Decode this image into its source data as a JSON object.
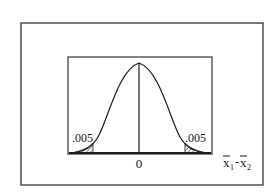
{
  "diagram": {
    "type": "normal-distribution",
    "left_tail_label": ".005",
    "right_tail_label": ".005",
    "center_label": "0",
    "axis_label": {
      "var1": "x",
      "sub1": "1",
      "sep": "-",
      "var2": "x",
      "sub2": "2"
    }
  },
  "colors": {
    "ink": "#1a1a1a",
    "background": "#ffffff"
  }
}
